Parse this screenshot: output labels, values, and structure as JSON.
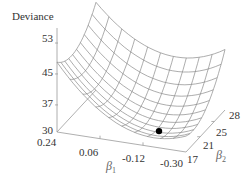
{
  "chart_data": {
    "type": "surface3d",
    "title": "",
    "zlabel": "Deviance",
    "xlabel": "β1",
    "ylabel": "β2",
    "x_ticks": [
      "0.24",
      "0.06",
      "-0.12",
      "-0.30"
    ],
    "y_ticks": [
      "17",
      "21",
      "25",
      "28"
    ],
    "z_ticks": [
      "30",
      "37",
      "45",
      "53"
    ],
    "xlim": [
      0.24,
      -0.3
    ],
    "ylim": [
      17,
      28
    ],
    "zlim": [
      30,
      53
    ],
    "grid": false,
    "mesh_resolution": [
      11,
      11
    ],
    "surface_corners": {
      "b1_0.24_b2_17": 47.8,
      "b1_0.24_b2_28": 52.0,
      "b1_-0.30_b2_28": 45.8,
      "b1_-0.30_b2_17": 40.0
    },
    "minimum": {
      "beta1": -0.15,
      "beta2": 19.5,
      "deviance": 31.5
    },
    "marker": {
      "label": "minimum",
      "color": "#000000"
    }
  },
  "labels": {
    "z_title": "Deviance",
    "x_title_base": "β",
    "x_title_sub": "1",
    "y_title_base": "β",
    "y_title_sub": "2",
    "z_ticks": [
      "53",
      "45",
      "37",
      "30"
    ],
    "x_ticks": [
      "0.24",
      "0.06",
      "-0.12",
      "-0.30"
    ],
    "y_ticks": [
      "28",
      "25",
      "21",
      "17"
    ]
  },
  "colors": {
    "mesh": "#8a8a8a",
    "axis": "#9a9a9a",
    "marker": "#000000"
  }
}
